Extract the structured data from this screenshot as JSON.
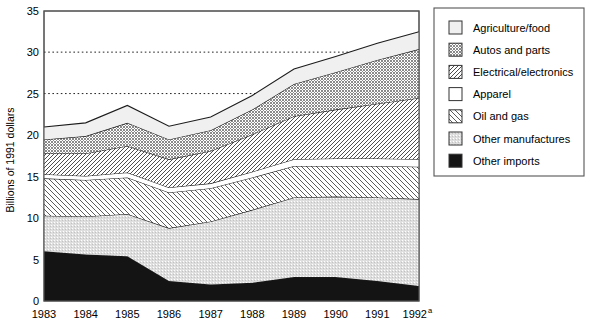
{
  "chart_data": {
    "type": "area",
    "stacked": true,
    "title": "",
    "subtitle": "",
    "xlabel": "",
    "ylabel": "Billions of 1991 dollars",
    "ylim": [
      0,
      35
    ],
    "yticks": [
      0,
      5,
      10,
      15,
      20,
      25,
      30,
      35
    ],
    "ytick_labels": [
      "0",
      "5",
      "10",
      "15",
      "20",
      "25",
      "30",
      "35"
    ],
    "gridlines": [
      25,
      30
    ],
    "grid": "dotted-horizontal-partial",
    "legend_position": "right",
    "categories": [
      "1983",
      "1984",
      "1985",
      "1986",
      "1987",
      "1988",
      "1989",
      "1990",
      "1991",
      "1992"
    ],
    "x_tick_labels": [
      "1983",
      "1984",
      "1985",
      "1986",
      "1987",
      "1988",
      "1989",
      "1990",
      "1991",
      "1992"
    ],
    "x_last_superscript": "a",
    "footnote_marker": "a",
    "series": [
      {
        "name": "Other imports",
        "pattern": "solid-black",
        "color": "#111111",
        "values": [
          6.0,
          5.6,
          5.4,
          2.4,
          2.0,
          2.2,
          2.9,
          2.9,
          2.4,
          1.8
        ]
      },
      {
        "name": "Other manufactures",
        "pattern": "light-stipple",
        "color": "#d0d0d0",
        "values": [
          4.3,
          4.6,
          5.1,
          6.4,
          7.6,
          8.8,
          9.6,
          9.7,
          10.1,
          10.5
        ]
      },
      {
        "name": "Oil and gas",
        "pattern": "diagonal-hatch-wide",
        "color": "#ffffff",
        "values": [
          4.5,
          4.4,
          4.4,
          4.3,
          4.0,
          3.9,
          3.8,
          3.7,
          3.8,
          3.9
        ]
      },
      {
        "name": "Apparel",
        "pattern": "white-plain",
        "color": "#ffffff",
        "values": [
          0.5,
          0.5,
          0.6,
          0.6,
          0.6,
          0.7,
          0.8,
          0.9,
          0.9,
          0.9
        ]
      },
      {
        "name": "Electrical/electronics",
        "pattern": "diagonal-hatch-narrow",
        "color": "#ffffff",
        "values": [
          2.5,
          2.7,
          3.2,
          3.4,
          3.9,
          4.5,
          5.2,
          5.9,
          6.6,
          7.4
        ]
      },
      {
        "name": "Autos and parts",
        "pattern": "dark-checker",
        "color": "#9a9a9a",
        "values": [
          1.7,
          2.1,
          2.8,
          2.4,
          2.5,
          3.0,
          3.9,
          4.5,
          5.3,
          5.9
        ]
      },
      {
        "name": "Agriculture/food",
        "pattern": "very-light-gray",
        "color": "#efefef",
        "values": [
          1.5,
          1.6,
          2.1,
          1.6,
          1.6,
          1.7,
          1.8,
          1.9,
          2.0,
          2.1
        ]
      }
    ],
    "totals": [
      21.0,
      21.5,
      23.6,
      21.1,
      22.2,
      24.8,
      28.0,
      29.5,
      31.1,
      32.5
    ]
  },
  "axis": {
    "y_label": "Billions of 1991 dollars",
    "y_ticks": [
      "35",
      "30",
      "25",
      "20",
      "15",
      "10",
      "5",
      "0"
    ],
    "x_ticks": [
      "1983",
      "1984",
      "1985",
      "1986",
      "1987",
      "1988",
      "1989",
      "1990",
      "1991",
      "1992"
    ],
    "x_last_superscript": "a"
  },
  "legend": {
    "items": [
      {
        "label": "Agriculture/food",
        "swatch": "very-light-gray"
      },
      {
        "label": "Autos and parts",
        "swatch": "dark-checker"
      },
      {
        "label": "Electrical/electronics",
        "swatch": "diagonal-hatch-narrow"
      },
      {
        "label": "Apparel",
        "swatch": "white-plain"
      },
      {
        "label": "Oil and gas",
        "swatch": "diagonal-hatch-wide"
      },
      {
        "label": "Other manufactures",
        "swatch": "light-stipple"
      },
      {
        "label": "Other imports",
        "swatch": "solid-black"
      }
    ]
  },
  "colors": {
    "frame": "#555555",
    "line": "#222222",
    "text": "#000000",
    "background": "#ffffff"
  }
}
